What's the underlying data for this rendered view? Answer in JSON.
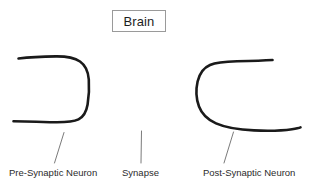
{
  "diagram": {
    "title_box": {
      "label": "Brain"
    },
    "shapes": [
      {
        "name": "pre-synaptic-neuron-shape",
        "description": "hand-drawn open D shape, opening to the left"
      },
      {
        "name": "post-synaptic-neuron-shape",
        "description": "hand-drawn open C shape, opening to the right"
      }
    ],
    "captions": [
      {
        "id": "pre",
        "label": "Pre-Synaptic Neuron"
      },
      {
        "id": "syn",
        "label": "Synapse"
      },
      {
        "id": "post",
        "label": "Post-Synaptic Neuron"
      }
    ],
    "colors": {
      "background": "#ffffff",
      "ink": "#1a1a1a",
      "leader": "#6b6b6b",
      "box_border": "#9a9a9a",
      "caption_text": "#2b2b2b"
    }
  }
}
